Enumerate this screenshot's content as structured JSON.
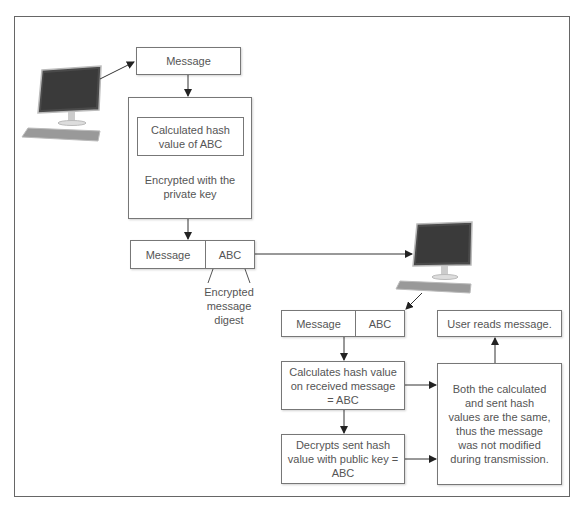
{
  "diagram": {
    "type": "digital-signature-flow",
    "sender": {
      "computer_icon": "desktop-computer-icon",
      "message_box": "Message",
      "hash_box": "Calculated hash value of ABC",
      "encrypt_note": "Encrypted with the private key",
      "signed_message": {
        "left": "Message",
        "right": "ABC"
      },
      "digest_label": "Encrypted message digest"
    },
    "receiver": {
      "computer_icon": "desktop-computer-icon",
      "received_message": {
        "left": "Message",
        "right": "ABC"
      },
      "calc_box": "Calculates hash value on received message = ABC",
      "decrypt_box": "Decrypts sent hash value with public key = ABC",
      "compare_box": "Both the calculated and sent hash values are the same, thus the message was not modified during transmission.",
      "result_box": "User reads message."
    },
    "colors": {
      "line": "#333333",
      "box_border": "#777777",
      "text": "#555555",
      "frame": "#666666"
    }
  }
}
